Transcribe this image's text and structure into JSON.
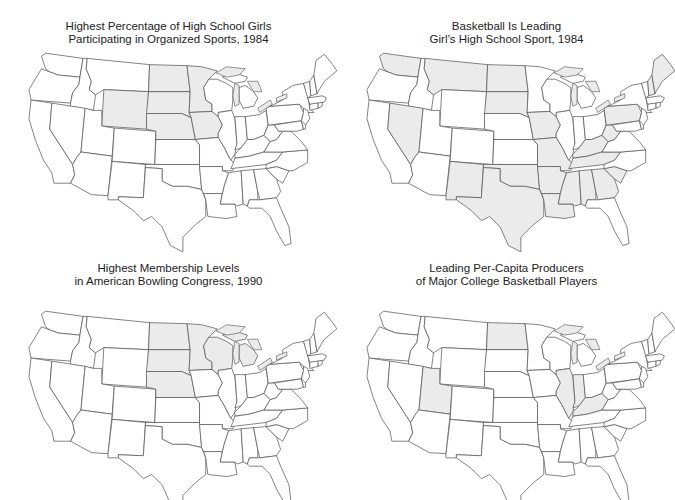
{
  "figure": {
    "colors": {
      "shaded": "#ebebeb",
      "unshaded": "#ffffff",
      "border": "#555555"
    }
  },
  "panels": [
    {
      "id": "girls-sports-participation",
      "title_line1": "Highest Percentage of High School Girls",
      "title_line2": "Participating in Organized Sports, 1984",
      "shaded_states": [
        "WY",
        "ND",
        "SD",
        "NE",
        "MN",
        "IA"
      ]
    },
    {
      "id": "basketball-leading-sport",
      "title_line1": "Basketball Is Leading",
      "title_line2": "Girl’s High School Sport, 1984",
      "shaded_states": [
        "WA",
        "MT",
        "ND",
        "SD",
        "NV",
        "NM",
        "TX",
        "OK",
        "IA",
        "MO",
        "AR",
        "LA",
        "MS",
        "AL",
        "GA",
        "SC",
        "TN",
        "KY",
        "WV",
        "PA",
        "ME",
        "NH"
      ]
    },
    {
      "id": "bowling-congress-membership",
      "title_line1": "Highest Membership Levels",
      "title_line2": "in American Bowling Congress, 1990",
      "shaded_states": [
        "ND",
        "SD",
        "NE",
        "MN",
        "WI",
        "MI"
      ]
    },
    {
      "id": "college-basketball-producers",
      "title_line1": "Leading Per-Capita Producers",
      "title_line2": "of Major College Basketball Players",
      "shaded_states": [
        "ND",
        "UT",
        "IL",
        "IN",
        "KY"
      ]
    }
  ],
  "chart_data": [
    {
      "type": "choropleth",
      "title": "Highest Percentage of High School Girls Participating in Organized Sports, 1984",
      "region": "Contiguous United States",
      "highlighted": [
        "Wyoming",
        "North Dakota",
        "South Dakota",
        "Nebraska",
        "Minnesota",
        "Iowa"
      ]
    },
    {
      "type": "choropleth",
      "title": "Basketball Is Leading Girl’s High School Sport, 1984",
      "region": "Contiguous United States",
      "highlighted": [
        "Washington",
        "Montana",
        "North Dakota",
        "South Dakota",
        "Nevada",
        "New Mexico",
        "Texas",
        "Oklahoma",
        "Iowa",
        "Missouri",
        "Arkansas",
        "Louisiana",
        "Mississippi",
        "Alabama",
        "Georgia",
        "South Carolina",
        "Tennessee",
        "Kentucky",
        "West Virginia",
        "Pennsylvania",
        "Maine",
        "New Hampshire"
      ]
    },
    {
      "type": "choropleth",
      "title": "Highest Membership Levels in American Bowling Congress, 1990",
      "region": "Contiguous United States",
      "highlighted": [
        "North Dakota",
        "South Dakota",
        "Nebraska",
        "Minnesota",
        "Wisconsin",
        "Michigan"
      ]
    },
    {
      "type": "choropleth",
      "title": "Leading Per-Capita Producers of Major College Basketball Players",
      "region": "Contiguous United States",
      "highlighted": [
        "North Dakota",
        "Utah",
        "Illinois",
        "Indiana",
        "Kentucky"
      ]
    }
  ]
}
